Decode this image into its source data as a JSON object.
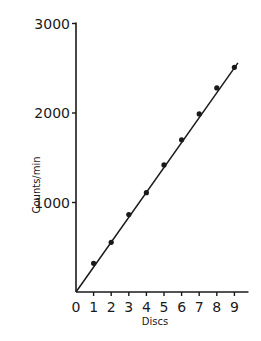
{
  "chart_data": {
    "type": "scatter",
    "title": "",
    "xlabel": "Discs",
    "ylabel": "Counts/min",
    "x": [
      1,
      2,
      3,
      4,
      5,
      6,
      7,
      8,
      9
    ],
    "series": [
      {
        "name": "Measured counts",
        "values": [
          320,
          555,
          865,
          1110,
          1420,
          1700,
          1990,
          2280,
          2510
        ],
        "style": "points"
      },
      {
        "name": "Linear fit",
        "style": "line",
        "x": [
          0,
          9.2
        ],
        "values": [
          0,
          2560
        ]
      }
    ],
    "x_ticks": [
      "0",
      "1",
      "2",
      "3",
      "4",
      "5",
      "6",
      "7",
      "8",
      "9"
    ],
    "y_ticks": [
      "1000",
      "2000",
      "3000"
    ],
    "xlim": [
      0,
      9.8
    ],
    "ylim": [
      0,
      3000
    ],
    "grid": false,
    "legend": null
  },
  "colors": {
    "ink": "#1a1a1a",
    "background": "#ffffff"
  }
}
